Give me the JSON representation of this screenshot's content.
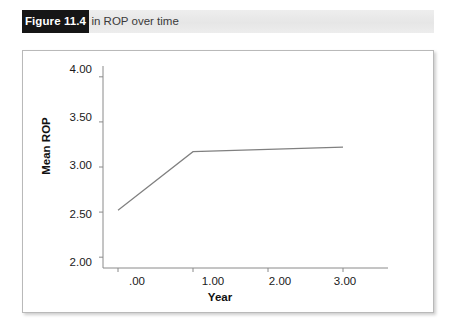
{
  "figure": {
    "number_label": "Figure 11.4",
    "caption": "Change in ROP over time"
  },
  "chart_data": {
    "type": "line",
    "title": "Change in ROP over time",
    "xlabel": "Year",
    "ylabel": "Mean ROP",
    "x": [
      0,
      1,
      3
    ],
    "values": [
      2.52,
      3.17,
      3.22
    ],
    "series": [
      {
        "name": "Mean ROP",
        "values": [
          2.52,
          3.17,
          3.22
        ]
      }
    ],
    "xlim": [
      -0.2,
      3.6
    ],
    "ylim": [
      1.88,
      4.12
    ],
    "xticks": [
      0,
      1,
      2,
      3
    ],
    "xtick_labels": [
      ".00",
      "1.00",
      "2.00",
      "3.00"
    ],
    "yticks": [
      2.0,
      2.5,
      3.0,
      3.5,
      4.0
    ],
    "ytick_labels": [
      "2.00",
      "2.50",
      "3.00",
      "3.50",
      "4.00"
    ],
    "grid": false,
    "legend": false,
    "line_color": "#808080",
    "axis_color": "#8a8a8a"
  },
  "colors": {
    "figure_box_bg": "#161616",
    "figure_box_text": "#ffffff",
    "caption_bar_bg": "#e9e9e9",
    "caption_text": "#3a3a3a",
    "panel_border": "#b9b9b9"
  }
}
